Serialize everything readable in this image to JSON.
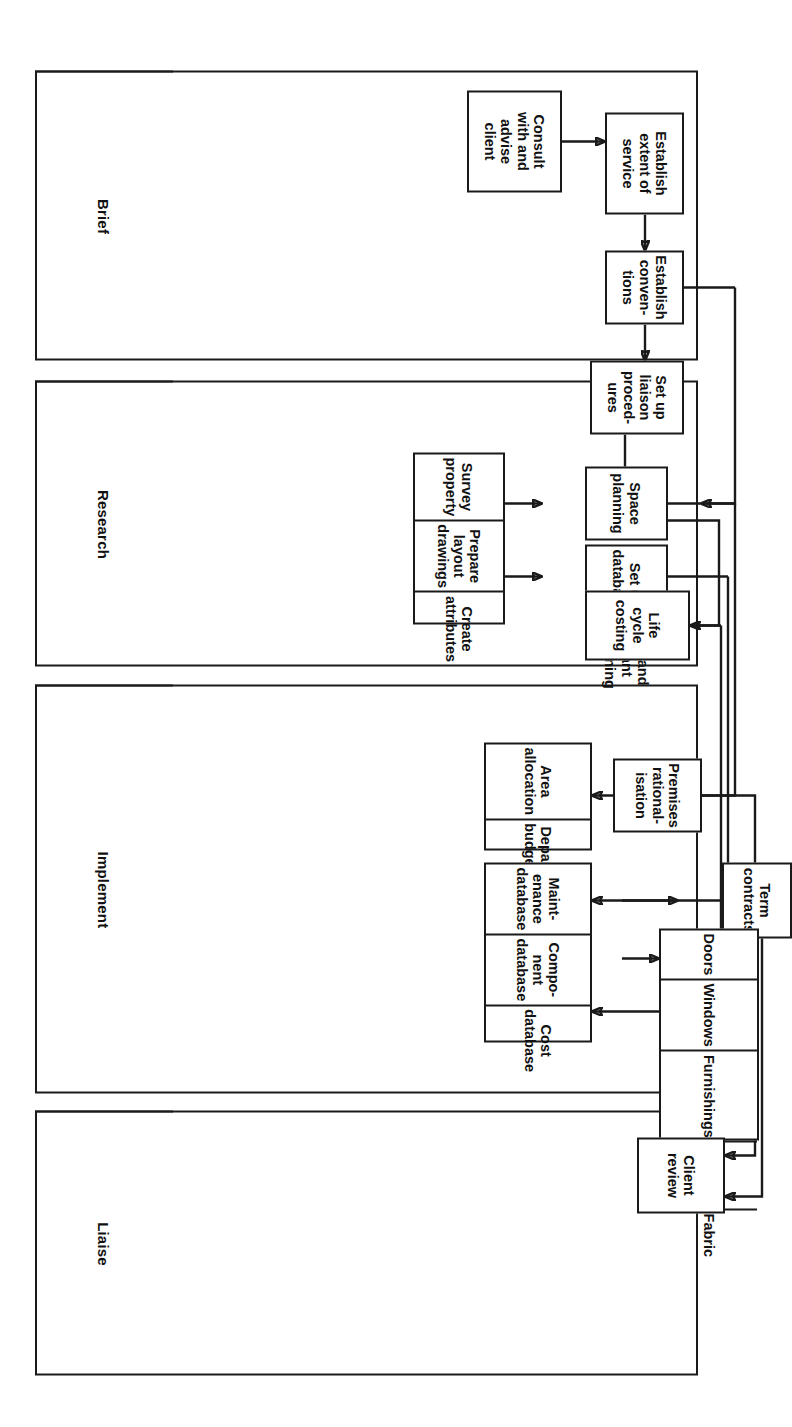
{
  "diagram": {
    "type": "swimlane-flowchart",
    "orientation": "rotated-90",
    "lanes": [
      {
        "id": "brief",
        "label": "Brief"
      },
      {
        "id": "research",
        "label": "Research"
      },
      {
        "id": "implement",
        "label": "Implement"
      },
      {
        "id": "liaise",
        "label": "Liaise"
      }
    ],
    "nodes": {
      "consult_client": {
        "lines": [
          "Consult",
          "with and",
          "advise",
          "client"
        ]
      },
      "establish_extent": {
        "lines": [
          "Establish",
          "extent of",
          "service"
        ]
      },
      "establish_conv": {
        "lines": [
          "Establish",
          "conven-",
          "tions"
        ]
      },
      "setup_liaison": {
        "lines": [
          "Set up",
          "liaison",
          "proced-",
          "ures"
        ]
      },
      "survey_property": {
        "lines": [
          "Survey",
          "property"
        ]
      },
      "prepare_layout": {
        "lines": [
          "Prepare",
          "layout",
          "drawings"
        ]
      },
      "create_attributes": {
        "lines": [
          "Create",
          "attributes"
        ]
      },
      "space_planning": {
        "lines": [
          "Space",
          "planning"
        ]
      },
      "setup_databases": {
        "lines": [
          "Set up",
          "databases"
        ]
      },
      "tax_grant_planning": {
        "lines": [
          "Tax and",
          "grant",
          "planning"
        ]
      },
      "life_cycle_costing": {
        "lines": [
          "Life",
          "cycle",
          "costing"
        ]
      },
      "area_allocation": {
        "lines": [
          "Area",
          "allocation"
        ]
      },
      "depart_budgets": {
        "lines": [
          "Depart.",
          "budgets"
        ]
      },
      "premises_rational": {
        "lines": [
          "Premises",
          "rational-",
          "isation"
        ]
      },
      "maintenance_db": {
        "lines": [
          "Maint-",
          "enance",
          "database"
        ]
      },
      "component_db": {
        "lines": [
          "Compo-",
          "nent",
          "database"
        ]
      },
      "cost_db": {
        "lines": [
          "Cost",
          "database"
        ]
      },
      "term_contracts": {
        "lines": [
          "Term",
          "contracts"
        ]
      },
      "client_review": {
        "lines": [
          "Client",
          "review"
        ]
      },
      "doors": {
        "lines": [
          "Doors"
        ]
      },
      "windows": {
        "lines": [
          "Windows"
        ]
      },
      "furnishings": {
        "lines": [
          "Furnishings"
        ]
      },
      "services": {
        "lines": [
          "Services"
        ]
      },
      "fabric": {
        "lines": [
          "Fabric"
        ]
      }
    },
    "edges": [
      {
        "from": "consult_client",
        "to": "establish_extent"
      },
      {
        "from": "establish_extent",
        "to": "establish_conv"
      },
      {
        "from": "establish_conv",
        "to": "setup_liaison"
      },
      {
        "from": "establish_conv",
        "to": "prepare_layout"
      },
      {
        "from": "setup_liaison",
        "to": "life_cycle_costing"
      },
      {
        "from": "prepare_layout",
        "to": "space_planning"
      },
      {
        "from": "create_attributes",
        "to": "setup_databases"
      },
      {
        "from": "space_planning",
        "to": "depart_budgets"
      },
      {
        "from": "setup_databases",
        "to": "maintenance_db"
      },
      {
        "from": "life_cycle_costing",
        "to": "cost_db"
      },
      {
        "from": "depart_budgets",
        "to": "premises_rational"
      },
      {
        "from": "maintenance_db",
        "to": "term_contracts"
      },
      {
        "from": "component_db",
        "to": "doors"
      },
      {
        "from": "premises_rational",
        "to": "client_review"
      },
      {
        "from": "term_contracts",
        "to": "client_review"
      }
    ],
    "colors": {
      "stroke": "#1a1a1a",
      "fill": "#ffffff"
    }
  }
}
